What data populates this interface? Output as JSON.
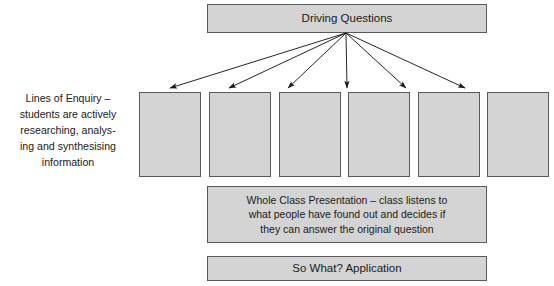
{
  "diagram": {
    "title_node": {
      "label": "Driving Questions"
    },
    "side_label": {
      "text": "Lines of Enquiry –\nstudents are actively\nresearching, analys-\ning and synthesising\ninformation"
    },
    "enquiry_boxes": [
      {
        "label": ""
      },
      {
        "label": ""
      },
      {
        "label": ""
      },
      {
        "label": ""
      },
      {
        "label": ""
      },
      {
        "label": ""
      }
    ],
    "presentation_node": {
      "label": "Whole Class Presentation – class listens to\nwhat people have found out and decides if\nthey can answer the original question"
    },
    "application_node": {
      "label": "So What? Application"
    },
    "colors": {
      "node_fill": "#d4d4d4",
      "node_border": "#5a5a5a",
      "arrow": "#1a1a1a",
      "text": "#1a1a1a",
      "background": "#ffffff"
    },
    "arrows": {
      "count": 6,
      "origin": {
        "x": 346,
        "y": 33
      },
      "targets": [
        {
          "x": 170,
          "y": 88
        },
        {
          "x": 229,
          "y": 88
        },
        {
          "x": 288,
          "y": 88
        },
        {
          "x": 347,
          "y": 88
        },
        {
          "x": 406,
          "y": 88
        },
        {
          "x": 465,
          "y": 88
        }
      ]
    }
  }
}
